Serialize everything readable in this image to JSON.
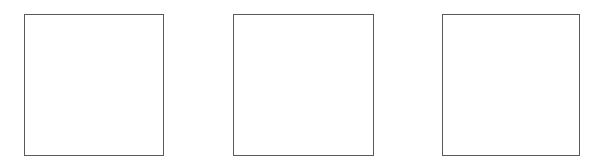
{
  "canvas": {
    "width": 597,
    "height": 168,
    "background": "#ffffff"
  },
  "boxes": [
    {
      "id": "box-1",
      "x": 24,
      "y": 14,
      "width": 140,
      "height": 142,
      "border_color": "#5a5a5a",
      "fill": "#ffffff",
      "label": ""
    },
    {
      "id": "box-2",
      "x": 233,
      "y": 14,
      "width": 141,
      "height": 142,
      "border_color": "#5a5a5a",
      "fill": "#ffffff",
      "label": ""
    },
    {
      "id": "box-3",
      "x": 442,
      "y": 14,
      "width": 138,
      "height": 142,
      "border_color": "#5a5a5a",
      "fill": "#ffffff",
      "label": ""
    }
  ]
}
